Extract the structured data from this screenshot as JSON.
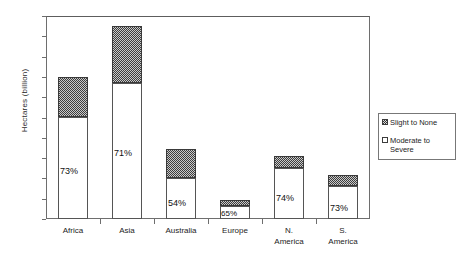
{
  "chart_data": {
    "type": "bar",
    "subtype": "stacked-vertical",
    "title": "",
    "xlabel": "",
    "ylabel": "Hectares (billion)",
    "ylim": [
      0,
      2
    ],
    "ytick_step": 0.2,
    "yticks": [
      "0",
      "0.2",
      "0.4",
      "0.6",
      "0.8",
      "1",
      "1.2",
      "1.4",
      "1.6",
      "1.8",
      "2"
    ],
    "grid": false,
    "legend_position": "right-outside",
    "categories": [
      "Africa",
      "Asia",
      "Australia",
      "Europe",
      "N.\nAmerica",
      "S.\nAmerica"
    ],
    "series": [
      {
        "name": "Moderate to Severe",
        "fill": "white",
        "values": [
          1.0,
          1.34,
          0.4,
          0.125,
          0.5,
          0.325
        ]
      },
      {
        "name": "Slight to None",
        "fill": "stipple-gray",
        "values": [
          0.4,
          0.56,
          0.29,
          0.065,
          0.12,
          0.105
        ]
      }
    ],
    "totals": [
      1.4,
      1.9,
      0.69,
      0.19,
      0.62,
      0.43
    ],
    "data_labels": [
      "73%",
      "71%",
      "54%",
      "65%",
      "74%",
      "73%"
    ],
    "annotations": []
  },
  "legend": {
    "items": [
      {
        "label": "Slight to None",
        "swatch": "stipple-gray-swatch"
      },
      {
        "label": "Moderate to Severe",
        "swatch": "white-swatch"
      }
    ]
  },
  "colors": {
    "axis": "#6e6e6e",
    "bar_outline": "#4a4a4a",
    "series_moderate_to_severe": "#ffffff",
    "series_slight_to_none": "#8a8a8a",
    "text": "#1a1a1a",
    "background": "#ffffff"
  }
}
